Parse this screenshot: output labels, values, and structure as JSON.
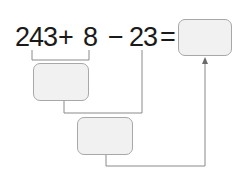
{
  "expression": {
    "operand1": "243",
    "op1": "+",
    "operand2": "8",
    "op2": "−",
    "operand3": "23",
    "equals": "="
  },
  "boxes": {
    "result": {
      "value": ""
    },
    "step1": {
      "value": ""
    },
    "step2": {
      "value": ""
    }
  },
  "colors": {
    "line": "#8a8a8a",
    "box_fill": "#f1f1f1",
    "box_border": "#a8a8a8",
    "text": "#1a1a1a"
  }
}
